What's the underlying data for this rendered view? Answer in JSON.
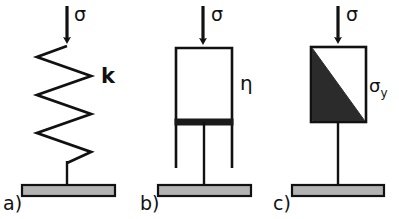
{
  "figure": {
    "width": 399,
    "height": 219,
    "background": "#ffffff",
    "stroke_color": "#111111",
    "plate_fill": "#b3b3b3",
    "slider_fill": "#2b2b2b",
    "piston_fill": "#1a1a1a"
  },
  "panels": [
    {
      "id": "a",
      "label": "a)",
      "element": "spring",
      "load_symbol": "σ",
      "parameter_symbol": "k",
      "description": "Hookean spring element with stiffness k loaded by stress sigma"
    },
    {
      "id": "b",
      "label": "b)",
      "element": "dashpot",
      "load_symbol": "σ",
      "parameter_symbol": "η",
      "description": "Newtonian dashpot element with viscosity eta loaded by stress sigma"
    },
    {
      "id": "c",
      "label": "c)",
      "element": "friction-slider",
      "load_symbol": "σ",
      "parameter_symbol": "σ",
      "parameter_subscript": "y",
      "description": "St. Venant friction slider element with yield stress sigma-y loaded by stress sigma"
    }
  ]
}
